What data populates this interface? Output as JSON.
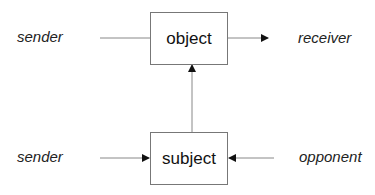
{
  "diagram": {
    "nodes": {
      "object": {
        "label": "object"
      },
      "subject": {
        "label": "subject"
      }
    },
    "labels": {
      "sender_top": "sender",
      "receiver": "receiver",
      "sender_bottom": "sender",
      "opponent": "opponent"
    },
    "edges": [
      {
        "from": "sender",
        "to": "object",
        "arrow": false
      },
      {
        "from": "object",
        "to": "receiver",
        "arrow": true
      },
      {
        "from": "subject",
        "to": "object",
        "arrow": true
      },
      {
        "from": "sender",
        "to": "subject",
        "arrow": true
      },
      {
        "from": "opponent",
        "to": "subject",
        "arrow": true
      }
    ]
  }
}
